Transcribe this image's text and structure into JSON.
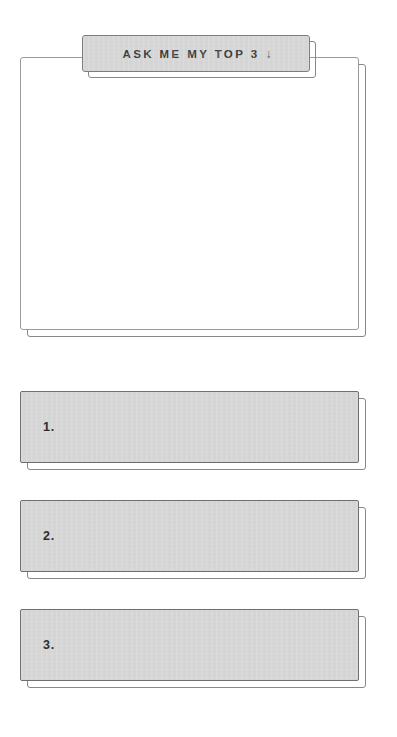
{
  "page": {
    "background_color": "#ffffff"
  },
  "header_tab": {
    "label": "ASK ME MY TOP 3",
    "arrow_icon": "arrow-down-icon",
    "arrow_glyph": "↓",
    "fill_color": "#d6d6d6",
    "border_color": "#7d7d7d",
    "text_color": "#3b3b3b"
  },
  "note_card": {
    "content": "",
    "fill_color": "#ffffff",
    "border_color": "#9a9a9a"
  },
  "answers": [
    {
      "number": "1.",
      "value": "",
      "fill_color": "#d6d6d6",
      "border_color": "#6f6f6f"
    },
    {
      "number": "2.",
      "value": "",
      "fill_color": "#d6d6d6",
      "border_color": "#6f6f6f"
    },
    {
      "number": "3.",
      "value": "",
      "fill_color": "#d6d6d6",
      "border_color": "#6f6f6f"
    }
  ],
  "shadow": {
    "color": "#888888",
    "offset_x": 7,
    "offset_y": 7
  }
}
